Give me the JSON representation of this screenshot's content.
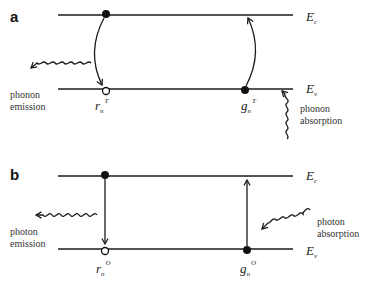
{
  "panels": [
    {
      "label": "a",
      "band_top": "E",
      "band_top_sub": "c",
      "band_bottom": "E",
      "band_bottom_sub": "v",
      "left_transition": {
        "symbol": "r",
        "sub": "n",
        "sup": "T",
        "direction": "down"
      },
      "right_transition": {
        "symbol": "g",
        "sub": "n",
        "sup": "T",
        "direction": "up"
      },
      "emission_label": [
        "phonon",
        "emission"
      ],
      "absorption_label": [
        "phonon",
        "absorption"
      ]
    },
    {
      "label": "b",
      "band_top": "E",
      "band_top_sub": "c",
      "band_bottom": "E",
      "band_bottom_sub": "v",
      "left_transition": {
        "symbol": "r",
        "sub": "n",
        "sup": "O",
        "direction": "down"
      },
      "right_transition": {
        "symbol": "g",
        "sub": "n",
        "sup": "O",
        "direction": "up"
      },
      "emission_label": [
        "photon",
        "emission"
      ],
      "absorption_label": [
        "photon",
        "absorption"
      ]
    }
  ],
  "colors": {
    "line": "#1a1a1a",
    "text": "#333333"
  }
}
